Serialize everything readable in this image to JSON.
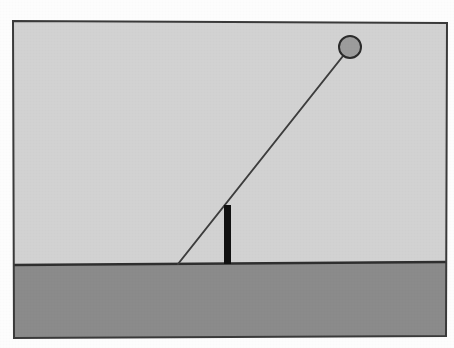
{
  "figure": {
    "canvas": {
      "width": 454,
      "height": 348,
      "background_color": "#fdfdfd"
    },
    "frame": {
      "name": "photo-border",
      "stroke_color": "#3a3a3a",
      "stroke_width": 2,
      "corners": {
        "top_left": [
          13,
          21
        ],
        "top_right": [
          447,
          23
        ],
        "bottom_right": [
          446,
          336
        ],
        "bottom_left": [
          14,
          338
        ]
      }
    },
    "sky": {
      "label": "sky-region",
      "fill_color": "#d2d2d2"
    },
    "ground": {
      "label": "ground-region",
      "fill_color": "#8b8b8b",
      "surface_line_color": "#2e2e2e",
      "surface_line_width": 2,
      "surface_left": [
        14,
        265
      ],
      "surface_right": [
        446,
        262
      ]
    },
    "rod": {
      "label": "rod",
      "stroke_color": "#3d3d3d",
      "stroke_width": 2,
      "pivot_point": [
        178,
        264
      ],
      "top_point": [
        343,
        56
      ],
      "angle_from_horizontal_deg": 52
    },
    "ball": {
      "label": "ball",
      "center": [
        350,
        47
      ],
      "radius": 11,
      "fill_color": "#9c9c9c",
      "stroke_color": "#2b2b2b",
      "stroke_width": 2
    },
    "post": {
      "label": "vertical-post",
      "x_left": 224,
      "x_right": 231,
      "y_top": 205,
      "y_bottom": 264,
      "fill_color": "#111111"
    }
  }
}
